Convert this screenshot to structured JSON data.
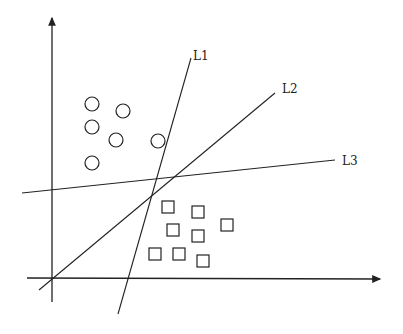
{
  "diagram": {
    "type": "linear-classifier-separating-lines",
    "colors": {
      "stroke": "#222222",
      "background": "#ffffff"
    },
    "axes": {
      "origin": [
        52,
        278
      ],
      "x_axis": {
        "from": [
          27,
          278
        ],
        "to": [
          380,
          279
        ]
      },
      "y_axis": {
        "from": [
          52,
          302
        ],
        "to": [
          52,
          18
        ]
      }
    },
    "lines": [
      {
        "label": "L1",
        "from": [
          118,
          314
        ],
        "to": [
          191,
          58
        ],
        "label_pos": [
          193,
          60
        ]
      },
      {
        "label": "L2",
        "from": [
          39,
          290
        ],
        "to": [
          275,
          93
        ],
        "label_pos": [
          282,
          93
        ]
      },
      {
        "label": "L3",
        "from": [
          22,
          193
        ],
        "to": [
          335,
          160
        ],
        "label_pos": [
          342,
          165
        ]
      }
    ],
    "class_circles": {
      "shape": "circle",
      "radius": 7,
      "points": [
        [
          92,
          104
        ],
        [
          123,
          111
        ],
        [
          92,
          127
        ],
        [
          116,
          140
        ],
        [
          158,
          141
        ],
        [
          92,
          163
        ]
      ]
    },
    "class_squares": {
      "shape": "square",
      "size": 12,
      "points": [
        [
          168,
          207
        ],
        [
          198,
          212
        ],
        [
          227,
          225
        ],
        [
          173,
          230
        ],
        [
          198,
          236
        ],
        [
          155,
          254
        ],
        [
          179,
          254
        ],
        [
          203,
          261
        ]
      ]
    }
  }
}
